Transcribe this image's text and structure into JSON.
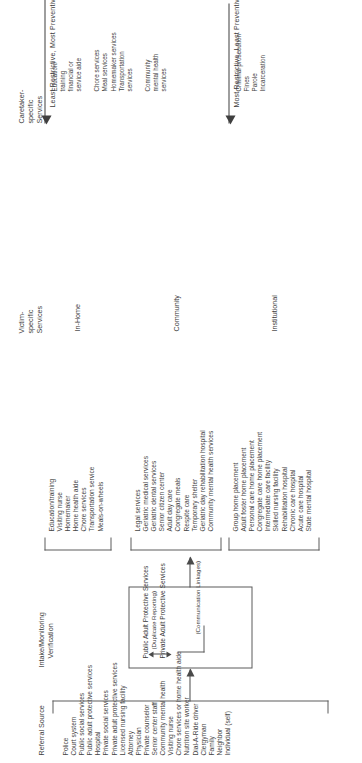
{
  "diagram": {
    "referral": {
      "header": "Referral Source",
      "items": [
        "Police",
        "Court system",
        "Public social services",
        "Public adult protective services",
        "Hospital",
        "Private social services",
        "Private adult protective services",
        "Licensed nursing facility",
        "Attorney",
        "Physician",
        "Private counselor",
        "Senior center staff",
        "Community mental health",
        "Visiting nurse",
        "Chore services or home health aide",
        "Nutrition site worker",
        "Dial-A-Ride driver",
        "Clergyman",
        "Family",
        "Neighbor",
        "Individual (self)"
      ]
    },
    "intake": {
      "header_line1": "Intake/Monitoring",
      "header_line2": "Verification",
      "box": {
        "public": "Public Adult Protective Services",
        "duplicate": "(Duplicate Reporting)",
        "private": "Private Adult Protective Services",
        "linkage": "(Communication Linkages)"
      }
    },
    "victim": {
      "header_line1": "Victim-",
      "header_line2": "specific",
      "header_line3": "Services",
      "groups": [
        {
          "label": "In-Home",
          "items": [
            "Education/training",
            "Visiting nurse",
            "Homemaker",
            "Home health aide",
            "Chore services",
            "Transportation service",
            "Meals-on-wheels"
          ]
        },
        {
          "label": "Community",
          "items": [
            "Legal services",
            "Geriatric medical services",
            "Geriatric dental services",
            "Senior citizen center",
            "Adult day care",
            "Congregate meals",
            "Respite care",
            "Temporary shelter",
            "Geriatric day rehabilitation hospital",
            "Community mental health services"
          ]
        },
        {
          "label": "Institutional",
          "items": [
            "Group home placement",
            "Adult foster home placement",
            "Personal care home placement",
            "Congregate care home placement",
            "Intermediate care facility",
            "Skilled nursing facility",
            "Rehabilitation hospital",
            "Chronic care hospital",
            "Acute care hospital",
            "State mental hospital"
          ]
        }
      ]
    },
    "caretaker": {
      "header_line1": "Caretaker-",
      "header_line2": "specific",
      "header_line3": "Services",
      "scales": [
        {
          "label": "Least Restrictive, Most Preventive",
          "groups": [
            {
              "items": [
                "Education/",
                "training",
                "financial or",
                "service aide"
              ]
            },
            {
              "items": [
                "Chore services",
                "Meal services",
                "Homemaker services",
                "Transportation",
                "services"
              ]
            },
            {
              "items": [
                "Community",
                "mental health",
                "services"
              ]
            }
          ]
        },
        {
          "label": "Most Restrictive, Least Preventive",
          "groups": [
            {
              "items": [
                "Criminal prosecution",
                "Fines",
                "Parole",
                "Incarceration"
              ]
            }
          ]
        }
      ]
    }
  }
}
